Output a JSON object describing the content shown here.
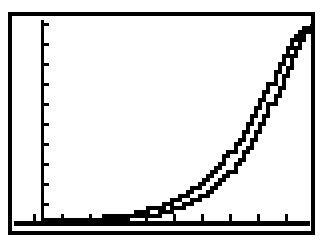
{
  "figure": {
    "background_color": "#ffffff",
    "ink_color": "#000000",
    "frame": {
      "name": "plot-border-rectangle",
      "x": 8,
      "y": 12,
      "width": 307,
      "height": 223,
      "stroke_width": 4
    }
  },
  "axes": {
    "y_axis": {
      "label": "",
      "position_x": 42,
      "top_y": 20,
      "bottom_y": 222,
      "stroke_width": 3,
      "tick_direction": "right",
      "tick_length": 7,
      "tick_count": 10,
      "tick_positions_y": [
        24,
        44,
        64,
        84,
        104,
        124,
        144,
        164,
        184,
        204
      ]
    },
    "x_axis": {
      "label": "",
      "position_y": 223,
      "left_x": 14,
      "right_x": 310,
      "stroke_width": 5,
      "tick_direction": "up",
      "tick_length": 7,
      "tick_count": 10,
      "tick_positions_x": [
        34,
        62,
        90,
        118,
        146,
        174,
        202,
        230,
        258,
        286
      ]
    }
  },
  "chart_data": {
    "type": "line",
    "title": "",
    "subtitle": "",
    "xlabel": "",
    "ylabel": "",
    "xlim": [
      0,
      10
    ],
    "ylim": [
      0,
      10
    ],
    "grid": false,
    "legend": "none",
    "annotations": [],
    "xtick_labels": [],
    "ytick_labels": [],
    "style": "pixelated-calculator-trace",
    "x": [
      0,
      0.5,
      1,
      1.5,
      2,
      2.5,
      3,
      3.5,
      4,
      4.5,
      5,
      5.5,
      6,
      6.5,
      7,
      7.5,
      8,
      8.5,
      9,
      9.5,
      10
    ],
    "series": [
      {
        "name": "upper-curve",
        "values": [
          0.02,
          0.03,
          0.05,
          0.08,
          0.12,
          0.18,
          0.27,
          0.39,
          0.56,
          0.78,
          1.08,
          1.47,
          1.98,
          2.63,
          3.45,
          4.45,
          5.62,
          6.95,
          8.33,
          9.35,
          10.0
        ]
      },
      {
        "name": "lower-curve",
        "values": [
          0.01,
          0.01,
          0.02,
          0.03,
          0.05,
          0.08,
          0.13,
          0.2,
          0.3,
          0.44,
          0.64,
          0.92,
          1.3,
          1.82,
          2.5,
          3.38,
          4.47,
          5.78,
          7.26,
          8.7,
          9.8
        ]
      }
    ]
  }
}
